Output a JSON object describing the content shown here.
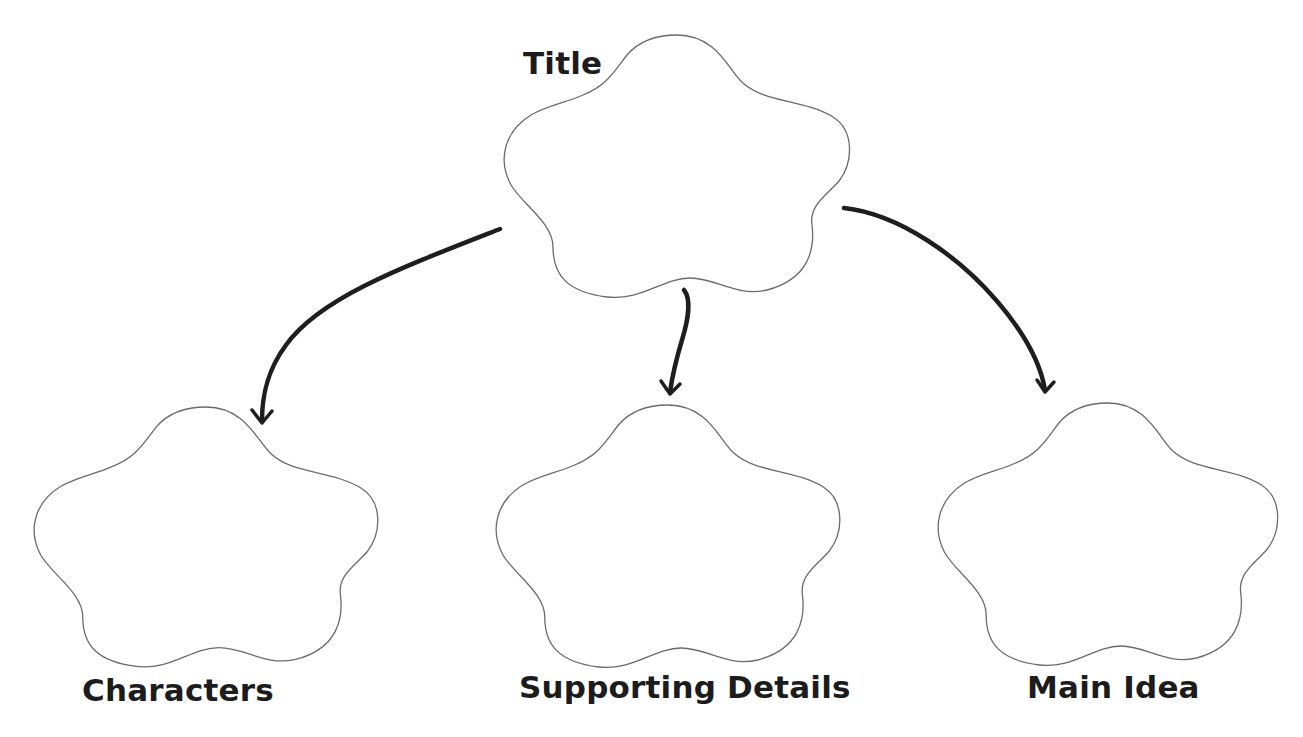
{
  "diagram": {
    "type": "graphic-organizer",
    "background": "#ffffff",
    "outline_color": "#6a6a6a",
    "arrow_color": "#1e1e1e",
    "text_color": "#1c1c1c",
    "nodes": [
      {
        "id": "title",
        "label": "Title",
        "shape": "flower"
      },
      {
        "id": "characters",
        "label": "Characters",
        "shape": "flower"
      },
      {
        "id": "supporting_details",
        "label": "Supporting Details",
        "shape": "flower"
      },
      {
        "id": "main_idea",
        "label": "Main Idea",
        "shape": "flower"
      }
    ],
    "edges": [
      {
        "from": "title",
        "to": "characters"
      },
      {
        "from": "title",
        "to": "supporting_details"
      },
      {
        "from": "title",
        "to": "main_idea"
      }
    ]
  }
}
